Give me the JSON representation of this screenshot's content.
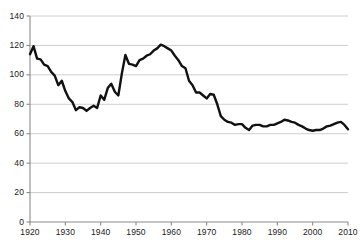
{
  "chart_data": {
    "type": "line",
    "title": "",
    "subtitle": "",
    "xlabel": "",
    "ylabel": "",
    "xlim": [
      1920,
      2010
    ],
    "ylim": [
      0,
      140
    ],
    "grid": true,
    "legend": false,
    "legend_position": "none",
    "line_color": "#111111",
    "grid_color": "#c8c8c8",
    "axis_color": "#8a8a8a",
    "y_ticks": [
      0,
      20,
      40,
      60,
      80,
      100,
      120,
      140
    ],
    "y_tick_labels": [
      "0",
      "20",
      "40",
      "60",
      "80",
      "100",
      "120",
      "140"
    ],
    "x_ticks": [
      1920,
      1930,
      1940,
      1950,
      1960,
      1970,
      1980,
      1990,
      2000,
      2010
    ],
    "x_tick_labels": [
      "1920",
      "1930",
      "1940",
      "1950",
      "1960",
      "1970",
      "1980",
      "1990",
      "2000",
      "2010"
    ],
    "series": [
      {
        "name": "rate",
        "color": "#111111",
        "x": [
          1920,
          1921,
          1922,
          1923,
          1924,
          1925,
          1926,
          1927,
          1928,
          1929,
          1930,
          1931,
          1932,
          1933,
          1934,
          1935,
          1936,
          1937,
          1938,
          1939,
          1940,
          1941,
          1942,
          1943,
          1944,
          1945,
          1946,
          1947,
          1948,
          1949,
          1950,
          1951,
          1952,
          1953,
          1954,
          1955,
          1956,
          1957,
          1958,
          1959,
          1960,
          1961,
          1962,
          1963,
          1964,
          1965,
          1966,
          1967,
          1968,
          1969,
          1970,
          1971,
          1972,
          1973,
          1974,
          1975,
          1976,
          1977,
          1978,
          1979,
          1980,
          1981,
          1982,
          1983,
          1984,
          1985,
          1986,
          1987,
          1988,
          1989,
          1990,
          1991,
          1992,
          1993,
          1994,
          1995,
          1996,
          1997,
          1998,
          1999,
          2000,
          2001,
          2002,
          2003,
          2004,
          2005,
          2006,
          2007,
          2008,
          2009,
          2010
        ],
        "y": [
          114,
          119.5,
          111,
          110.5,
          107,
          106,
          102,
          99.5,
          93,
          96,
          89,
          84,
          81.5,
          76,
          78,
          77.5,
          75.5,
          77.5,
          79,
          77.5,
          86,
          83,
          91,
          94,
          88.5,
          86,
          101,
          113.5,
          107.5,
          107,
          106,
          110,
          111,
          113,
          114,
          116.5,
          118,
          120.5,
          119.5,
          118,
          116.5,
          113,
          110,
          106,
          104.5,
          96,
          93,
          88,
          88,
          86,
          84,
          87,
          86.5,
          80,
          72,
          69.5,
          68,
          67.5,
          66,
          66.5,
          66.5,
          64,
          62.5,
          65.5,
          66,
          66,
          65,
          65,
          66,
          66,
          67,
          68,
          69.5,
          69,
          68,
          67.5,
          66,
          65,
          63.5,
          62.5,
          62,
          62.5,
          62.5,
          63.5,
          65,
          65.5,
          66.5,
          67.5,
          68,
          66,
          63
        ]
      }
    ]
  },
  "axes": {
    "y_axis_name": "y-axis",
    "x_axis_name": "x-axis"
  }
}
